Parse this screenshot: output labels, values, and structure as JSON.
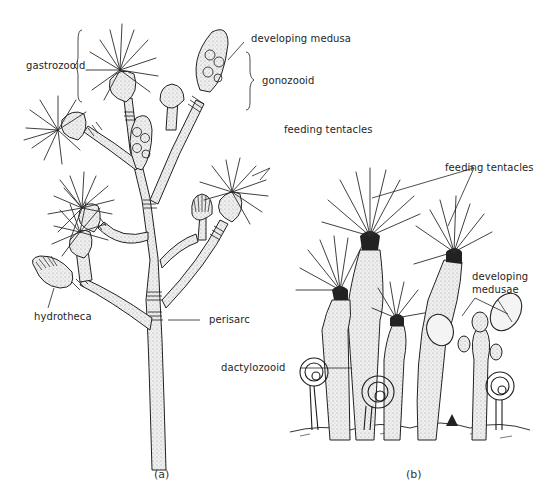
{
  "figure": {
    "panels": [
      {
        "id": "a",
        "label": "(a)"
      },
      {
        "id": "b",
        "label": "(b)"
      }
    ]
  },
  "labels": {
    "gastrozooid": "gastrozooid",
    "developing_medusa": "developing medusa",
    "gonozooid": "gonozooid",
    "feeding_tentacles_a": "feeding tentacles",
    "feeding_tentacles_b": "feeding tentacles",
    "hydrotheca": "hydrotheca",
    "perisarc": "perisarc",
    "dactylozooid": "dactylozooid",
    "developing_medusae_line1": "developing",
    "developing_medusae_line2": "medusae"
  },
  "colors": {
    "ink": "#1c1c1c",
    "background": "#ffffff",
    "stipple": "#9a9a9a"
  }
}
